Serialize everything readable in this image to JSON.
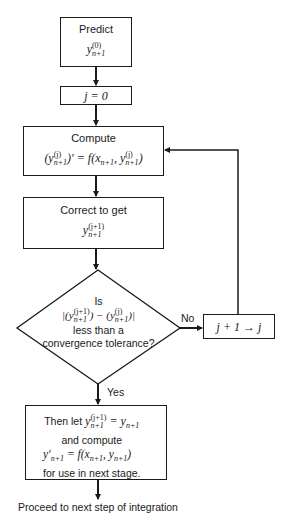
{
  "diagram": {
    "type": "flowchart",
    "nodes": {
      "predict": {
        "label": "Predict",
        "math_base": "y",
        "math_sup": "(0)",
        "math_sub": "n+1"
      },
      "init": {
        "label": "j = 0"
      },
      "compute": {
        "label": "Compute",
        "math_lhs_base": "(y",
        "math_lhs_sup": "(j)",
        "math_lhs_sub": "n+1",
        "math_lhs_tail": ")′ = f(x",
        "math_x_sub": "n+1",
        "math_comma": ", y",
        "math_rhs_sup": "(j)",
        "math_rhs_sub": "n+1",
        "math_close": ")"
      },
      "correct": {
        "label": "Correct to get",
        "math_base": "y",
        "math_sup": "(j+1)",
        "math_sub": "n+1"
      },
      "decision": {
        "line1": "Is",
        "line2_open": "|(y",
        "line2_sup1": "(j+1)",
        "line2_sub1": "n+1",
        "line2_mid": ") − (y",
        "line2_sup2": "(j)",
        "line2_sub2": "n+1",
        "line2_close": ")|",
        "line3": "less than a",
        "line4": "convergence tolerance?"
      },
      "increment": {
        "label": "j + 1 → j"
      },
      "finalize": {
        "line1_text": "Then let ",
        "line1_base": "y",
        "line1_sup": "(j+1)",
        "line1_sub": "n+1",
        "line1_eq": " = y",
        "line1_eq_sub": "n+1",
        "line2": "and compute",
        "line3_base": "y′",
        "line3_sub": "n+1",
        "line3_eq": " = f(x",
        "line3_x_sub": "n+1",
        "line3_comma": ", y",
        "line3_y_sub": "n+1",
        "line3_close": ")",
        "line4": "for use in next stage."
      }
    },
    "edges": {
      "yes_label": "Yes",
      "no_label": "No"
    },
    "footer": "Proceed to next step of integration"
  }
}
